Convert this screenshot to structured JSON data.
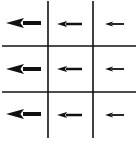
{
  "diagram": {
    "type": "grid-vector-field",
    "rows": 3,
    "cols": 3,
    "direction": "left",
    "line_color": "#111111",
    "arrow_color": "#111111",
    "background": "#ffffff",
    "grid": {
      "vertical_lines_x": [
        48,
        93
      ],
      "horizontal_lines_y": [
        46,
        92
      ],
      "v_extent": [
        1,
        138
      ],
      "h_extent": [
        2,
        136
      ]
    },
    "arrows": [
      {
        "row": 0,
        "col": 0,
        "tip_x": 6,
        "tail_x": 41,
        "y": 23,
        "size": "large"
      },
      {
        "row": 0,
        "col": 1,
        "tip_x": 57,
        "tail_x": 82,
        "y": 24,
        "size": "medium"
      },
      {
        "row": 0,
        "col": 2,
        "tip_x": 105,
        "tail_x": 124,
        "y": 24,
        "size": "small"
      },
      {
        "row": 1,
        "col": 0,
        "tip_x": 6,
        "tail_x": 41,
        "y": 69,
        "size": "large"
      },
      {
        "row": 1,
        "col": 1,
        "tip_x": 57,
        "tail_x": 82,
        "y": 69,
        "size": "medium"
      },
      {
        "row": 1,
        "col": 2,
        "tip_x": 105,
        "tail_x": 124,
        "y": 69,
        "size": "small"
      },
      {
        "row": 2,
        "col": 0,
        "tip_x": 6,
        "tail_x": 41,
        "y": 114,
        "size": "large"
      },
      {
        "row": 2,
        "col": 1,
        "tip_x": 57,
        "tail_x": 82,
        "y": 115,
        "size": "medium"
      },
      {
        "row": 2,
        "col": 2,
        "tip_x": 105,
        "tail_x": 124,
        "y": 115,
        "size": "small"
      }
    ],
    "size_styles": {
      "large": {
        "head_len": 18,
        "head_half": 5,
        "shaft_w": 4
      },
      "medium": {
        "head_len": 10,
        "head_half": 3,
        "shaft_w": 2.5
      },
      "small": {
        "head_len": 8,
        "head_half": 2.5,
        "shaft_w": 1.8
      }
    }
  }
}
